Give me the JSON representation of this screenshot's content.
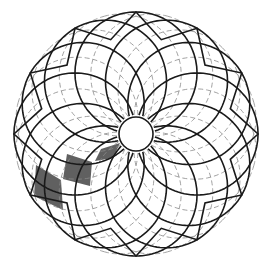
{
  "figure": {
    "type": "spiral rosette tessellation",
    "symmetry_order": 12,
    "center": [
      136,
      134
    ],
    "outer_radius": 122,
    "inner_circle_radius": 17,
    "colors": {
      "background": "#ffffff",
      "solid_line": "#1a1a1a",
      "dashed_line": "#8a8a8a",
      "shaded_cell": "#606060"
    },
    "shaded_cells": [
      {
        "label": "outer-cell",
        "points": [
          [
            36,
            165
          ],
          [
            61,
            180
          ],
          [
            63,
            210
          ],
          [
            34,
            196
          ]
        ]
      },
      {
        "label": "middle-cell",
        "points": [
          [
            67,
            154
          ],
          [
            92,
            162
          ],
          [
            90,
            186
          ],
          [
            63,
            179
          ]
        ]
      },
      {
        "label": "inner-cell",
        "points": [
          [
            95,
            161
          ],
          [
            101,
            149
          ],
          [
            120,
            143
          ],
          [
            113,
            158
          ]
        ]
      }
    ]
  }
}
